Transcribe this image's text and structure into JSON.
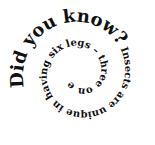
{
  "spiral": {
    "headline": "Did you know?",
    "body": " Insects are unique in having six legs – three on either side.",
    "text_color": "#111111",
    "background": "#ffffff",
    "direction": "clockwise-inward"
  }
}
